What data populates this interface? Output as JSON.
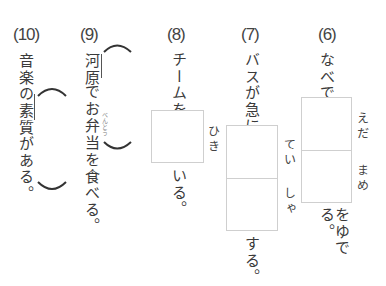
{
  "worksheet": {
    "questions": [
      {
        "number": "(6)",
        "before": "なべで",
        "box_readings": [
          "えだ",
          "まめ"
        ],
        "after": "をゆでる。"
      },
      {
        "number": "(7)",
        "before": "バスが急に",
        "box_readings": [
          "てい",
          "しゃ"
        ],
        "after": "する。"
      },
      {
        "number": "(8)",
        "before": "チームを",
        "box_readings": [
          "ひき"
        ],
        "after": "いる。"
      },
      {
        "number": "(9)",
        "sentence_underlined": "河原",
        "sentence_rest": "でお弁当を食べる。",
        "sentence_part1": "でお",
        "sentence_part2": "弁当",
        "sentence_part3": "を食べる。",
        "furigana": "べんとう"
      },
      {
        "number": "(10)",
        "sentence_part1": "音楽の",
        "sentence_underlined": "素質",
        "sentence_part2": "がある。"
      }
    ]
  }
}
